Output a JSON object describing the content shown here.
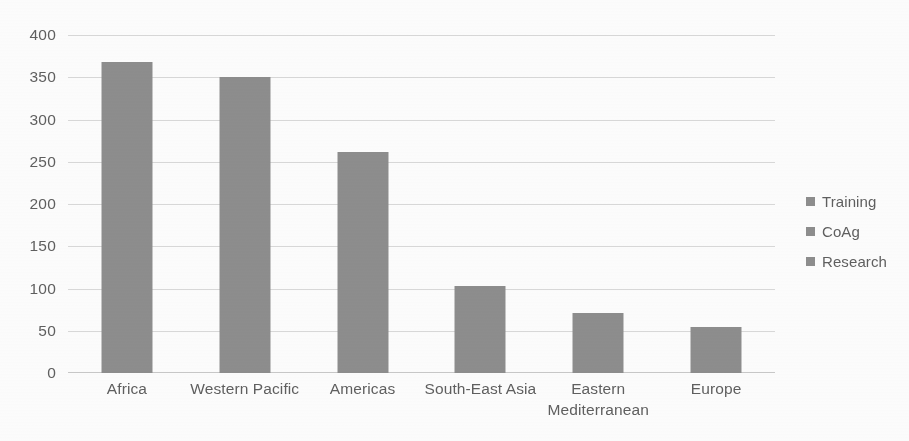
{
  "chart_data": {
    "type": "bar",
    "title": "",
    "subtitle": "",
    "xlabel": "",
    "ylabel": "",
    "categories": [
      "Africa",
      "Western Pacific",
      "Americas",
      "South-East Asia",
      "Eastern Mediterranean",
      "Europe"
    ],
    "category_lines": [
      [
        "Africa"
      ],
      [
        "Western Pacific"
      ],
      [
        "Americas"
      ],
      [
        "South-East Asia"
      ],
      [
        "Eastern",
        "Mediterranean"
      ],
      [
        "Europe"
      ]
    ],
    "series": [
      {
        "name": "Training",
        "values": [
          368,
          350,
          262,
          103,
          71,
          55
        ],
        "color": "#8b8b8b"
      }
    ],
    "legend_entries": [
      "Training",
      "CoAg",
      "Research"
    ],
    "legend_position": "right",
    "ylim": [
      0,
      400
    ],
    "ytick_step": 50,
    "yticks": [
      "400",
      "350",
      "300",
      "250",
      "200",
      "150",
      "100",
      "50",
      "0"
    ],
    "ytick_values": [
      400,
      350,
      300,
      250,
      200,
      150,
      100,
      50,
      0
    ],
    "grid": true,
    "grid_color": "#d9d9d9",
    "bar_color": "#8b8b8b",
    "text_color": "#5b5b5b",
    "background": "#ffffff"
  }
}
